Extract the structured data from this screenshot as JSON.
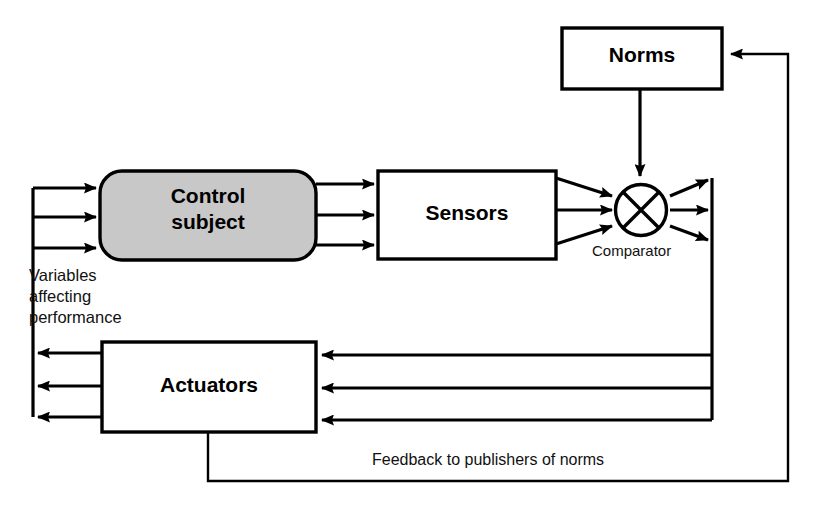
{
  "diagram": {
    "background_color": "#ffffff",
    "line_color": "#000000",
    "nodes": {
      "control_subject": {
        "label": "Control\nsubject",
        "shape": "rounded-rectangle",
        "fill": "#c8c8c8",
        "x": 100,
        "y": 171,
        "w": 216,
        "h": 89
      },
      "sensors": {
        "label": "Sensors",
        "shape": "rectangle",
        "fill": "#ffffff",
        "x": 378,
        "y": 171,
        "w": 178,
        "h": 88
      },
      "norms": {
        "label": "Norms",
        "shape": "rectangle",
        "fill": "#ffffff",
        "x": 562,
        "y": 28,
        "w": 160,
        "h": 61
      },
      "actuators": {
        "label": "Actuators",
        "shape": "rectangle",
        "fill": "#ffffff",
        "x": 102,
        "y": 342,
        "w": 214,
        "h": 90
      },
      "comparator": {
        "label": "Comparator",
        "shape": "circle-with-cross",
        "fill": "#ffffff",
        "cx": 641,
        "cy": 210,
        "r": 25
      }
    },
    "annotations": {
      "variables": "Variables\naffecting\nperformance",
      "feedback": "Feedback  to publishers of norms"
    },
    "edges": [
      {
        "from": "left-spine",
        "to": "control_subject",
        "count": 3,
        "direction": "right"
      },
      {
        "from": "control_subject",
        "to": "sensors",
        "count": 3,
        "direction": "right"
      },
      {
        "from": "sensors",
        "to": "comparator",
        "count": 3,
        "direction": "right"
      },
      {
        "from": "norms",
        "to": "comparator",
        "count": 1,
        "direction": "down"
      },
      {
        "from": "comparator",
        "to": "right-spine",
        "count": 3,
        "direction": "right"
      },
      {
        "from": "right-spine",
        "to": "actuators",
        "count": 3,
        "direction": "left"
      },
      {
        "from": "actuators",
        "to": "left-spine",
        "count": 3,
        "direction": "left"
      },
      {
        "from": "actuators",
        "to": "norms",
        "count": 1,
        "direction": "feedback-loop"
      }
    ]
  }
}
